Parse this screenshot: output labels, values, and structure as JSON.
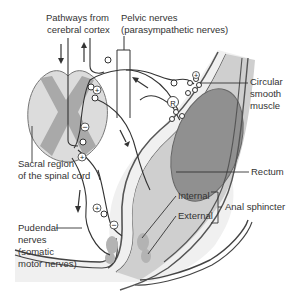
{
  "diagram": {
    "labels": {
      "pathways_line1": "Pathways from",
      "pathways_line2": "cerebral cortex",
      "pelvic_line1": "Pelvic nerves",
      "pelvic_line2": "(parasympathetic nerves)",
      "circular_line1": "Circular",
      "circular_line2": "smooth",
      "circular_line3": "muscle",
      "sacral_line1": "Sacral region",
      "sacral_line2": "of the spinal cord",
      "rectum": "Rectum",
      "internal": "Internal",
      "external": "External",
      "anal_sphincter": "Anal sphincter",
      "pudendal_line1": "Pudendal",
      "pudendal_line2": "nerves",
      "pudendal_line3": "(somatic",
      "pudendal_line4": "motor nerves)"
    },
    "symbols": {
      "excitatory": "+",
      "inhibitory": "−",
      "receptor": "R"
    },
    "colors": {
      "line": "#333333",
      "gray_matter": "#a9a9a9",
      "white_matter": "#dcdcdc",
      "rectum_wall": "#c8c8c8",
      "rectum_lumen": "#8f8f8f",
      "tissue": "#eeeeee",
      "sphincter": "#b5b5b5"
    }
  }
}
